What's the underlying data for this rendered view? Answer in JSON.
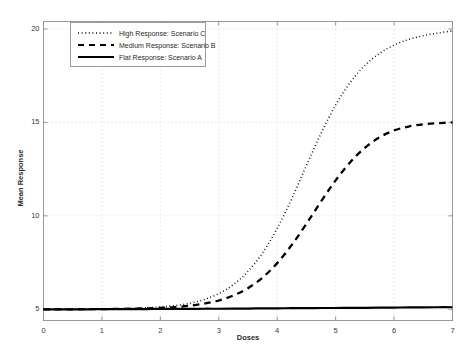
{
  "chart_data": {
    "type": "line",
    "title": "",
    "subtitle": "",
    "xlabel": "Doses",
    "ylabel": "Mean Response",
    "xlim": [
      0,
      7
    ],
    "ylim": [
      4.4,
      20.4
    ],
    "xticks": [
      "0",
      "1",
      "2",
      "3",
      "4",
      "5",
      "6",
      "7"
    ],
    "xtick_values": [
      0,
      1,
      2,
      3,
      4,
      5,
      6,
      7
    ],
    "yticks": [
      "5",
      "10",
      "15",
      "20"
    ],
    "ytick_values": [
      5,
      10,
      15,
      20
    ],
    "grid": true,
    "grid_style": "dotted",
    "legend_position": "upper-left",
    "x": [
      0,
      0.25,
      0.5,
      0.75,
      1,
      1.25,
      1.5,
      1.75,
      2,
      2.25,
      2.5,
      2.75,
      3,
      3.25,
      3.5,
      3.75,
      4,
      4.25,
      4.5,
      4.75,
      5,
      5.25,
      5.5,
      5.75,
      6,
      6.25,
      6.5,
      6.75,
      7
    ],
    "series": [
      {
        "name": "High Response: Scenario C",
        "style": "dotted",
        "color": "#000000",
        "values": [
          5.0,
          5.0,
          5.01,
          5.01,
          5.02,
          5.03,
          5.05,
          5.08,
          5.12,
          5.2,
          5.32,
          5.52,
          5.84,
          6.32,
          7.03,
          8.02,
          9.33,
          10.93,
          12.69,
          14.41,
          15.93,
          17.14,
          18.05,
          18.69,
          19.14,
          19.44,
          19.64,
          19.78,
          19.9
        ]
      },
      {
        "name": "Medium Response: Scenario B",
        "style": "dashed",
        "color": "#000000",
        "values": [
          5.0,
          5.0,
          5.0,
          5.01,
          5.01,
          5.02,
          5.03,
          5.05,
          5.08,
          5.12,
          5.19,
          5.3,
          5.47,
          5.74,
          6.13,
          6.7,
          7.47,
          8.45,
          9.58,
          10.77,
          11.9,
          12.87,
          13.64,
          14.2,
          14.57,
          14.78,
          14.9,
          14.96,
          15.0
        ]
      },
      {
        "name": "Flat Response: Scenario A",
        "style": "solid",
        "color": "#000000",
        "values": [
          5.0,
          5.0,
          5.0,
          5.0,
          5.01,
          5.01,
          5.01,
          5.01,
          5.02,
          5.02,
          5.02,
          5.03,
          5.03,
          5.04,
          5.04,
          5.05,
          5.05,
          5.06,
          5.06,
          5.07,
          5.07,
          5.08,
          5.08,
          5.09,
          5.09,
          5.1,
          5.1,
          5.11,
          5.11
        ]
      }
    ]
  },
  "legend": {
    "items": [
      {
        "label": "High Response: Scenario C",
        "style": "dotted"
      },
      {
        "label": "Medium Response: Scenario B",
        "style": "dashed"
      },
      {
        "label": "Flat Response: Scenario A",
        "style": "solid"
      }
    ]
  },
  "axes": {
    "xlabel": "Doses",
    "ylabel": "Mean Response",
    "xticks": [
      "0",
      "1",
      "2",
      "3",
      "4",
      "5",
      "6",
      "7"
    ],
    "yticks": [
      "5",
      "10",
      "15",
      "20"
    ]
  },
  "colors": {
    "line": "#000000",
    "axis": "#8a8a8a",
    "grid": "#c8c8c8",
    "background": "#ffffff"
  }
}
